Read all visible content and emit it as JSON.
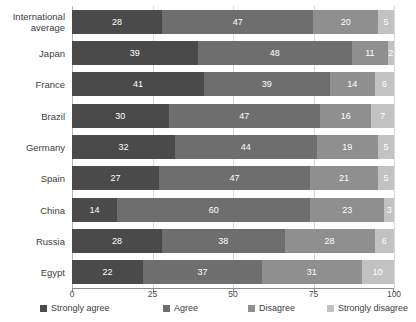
{
  "chart_data": {
    "type": "bar",
    "orientation": "horizontal",
    "stacked": true,
    "stacked_mode": "percent",
    "title": "",
    "subtitle": "",
    "xlabel": "",
    "ylabel": "",
    "xlim": [
      0,
      100
    ],
    "xticks": [
      0,
      25,
      50,
      75,
      100
    ],
    "xtick_labels": [
      "0",
      "25",
      "50",
      "75",
      "100"
    ],
    "grid": true,
    "grid_axis": "x",
    "legend_position": "bottom",
    "categories": [
      "International average",
      "Japan",
      "France",
      "Brazil",
      "Germany",
      "Spain",
      "China",
      "Russia",
      "Egypt"
    ],
    "series": [
      {
        "name": "Strongly agree",
        "color": "#4a4a4a",
        "values": [
          28,
          39,
          41,
          30,
          32,
          27,
          14,
          28,
          22
        ]
      },
      {
        "name": "Agree",
        "color": "#6e6e6e",
        "values": [
          47,
          48,
          39,
          47,
          44,
          47,
          60,
          38,
          37
        ]
      },
      {
        "name": "Disagree",
        "color": "#8f8f8f",
        "values": [
          20,
          11,
          14,
          16,
          19,
          21,
          23,
          28,
          31
        ]
      },
      {
        "name": "Strongly disagree",
        "color": "#c2c2c2",
        "values": [
          5,
          2,
          6,
          7,
          5,
          5,
          3,
          6,
          10
        ]
      }
    ]
  },
  "legend": {
    "items": [
      {
        "label": "Strongly agree",
        "color": "#4a4a4a",
        "left": 0
      },
      {
        "label": "Agree",
        "color": "#6e6e6e",
        "left": 123
      },
      {
        "label": "Disagree",
        "color": "#8f8f8f",
        "left": 208
      },
      {
        "label": "Strongly disagree",
        "color": "#c2c2c2",
        "left": 287
      }
    ]
  },
  "watermark": {
    "text": "https://hss.g118.csa-research.com/reports/on/8357/Marketing"
  },
  "colors": {
    "strongly_agree": "#4a4a4a",
    "agree": "#6e6e6e",
    "disagree": "#8f8f8f",
    "strongly_disagree": "#c2c2c2",
    "gridline": "#d9d9d9",
    "axis": "#8a8a8a",
    "text": "#3d3d3d",
    "value_text": "#ffffff",
    "background": "#ffffff"
  }
}
